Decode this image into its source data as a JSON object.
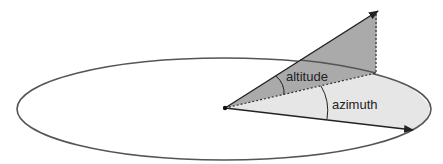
{
  "diagram": {
    "labels": {
      "altitude": "altitude",
      "azimuth": "azimuth"
    },
    "colors": {
      "stroke": "#555555",
      "arrow": "#222222",
      "altitude_fill": "#aaaaaa",
      "azimuth_fill": "#e6e6e6",
      "background": "#ffffff"
    }
  }
}
